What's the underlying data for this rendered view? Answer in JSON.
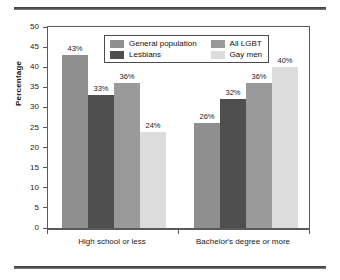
{
  "chart_data": {
    "type": "bar",
    "title": "",
    "xlabel": "",
    "ylabel": "Percentage",
    "ylim": [
      0,
      50
    ],
    "yticks": [
      0,
      5,
      10,
      15,
      20,
      25,
      30,
      35,
      40,
      45,
      50
    ],
    "grid": false,
    "legend_position": "top-center-inside",
    "categories": [
      "High school or less",
      "Bachelor's degree or more"
    ],
    "series": [
      {
        "name": "General population",
        "color": "#8f8f8f",
        "values": [
          43,
          26
        ],
        "labels": [
          "43%",
          "26%"
        ]
      },
      {
        "name": "Lesbians",
        "color": "#4f4f4f",
        "values": [
          33,
          32
        ],
        "labels": [
          "33%",
          "32%"
        ]
      },
      {
        "name": "All LGBT",
        "color": "#9a9a9a",
        "values": [
          36,
          36
        ],
        "labels": [
          "36%",
          "36%"
        ]
      },
      {
        "name": "Gay men",
        "color": "#dcdcdc",
        "values": [
          24,
          40
        ],
        "labels": [
          "24%",
          "40%"
        ]
      }
    ]
  }
}
